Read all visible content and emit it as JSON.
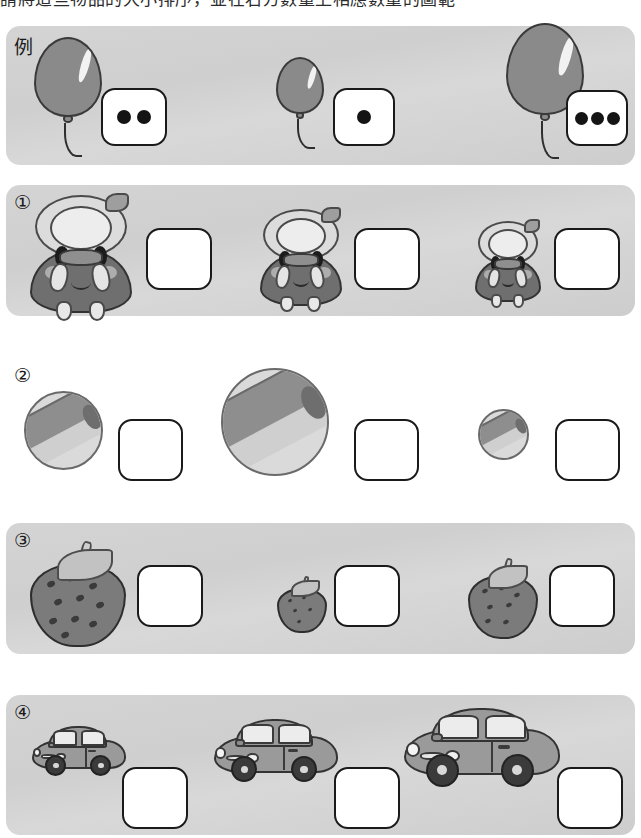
{
  "instruction": {
    "text": "請將這些物品的大小排序，並在右方數量上相應數量的圖範"
  },
  "example_row": {
    "label": "例",
    "items": [
      {
        "icon": "balloon-icon",
        "size": "medium",
        "dots": 2
      },
      {
        "icon": "balloon-icon",
        "size": "small",
        "dots": 1
      },
      {
        "icon": "balloon-icon",
        "size": "large",
        "dots": 3
      }
    ]
  },
  "rows": [
    {
      "label": "①",
      "subject": "doll",
      "background": "shaded",
      "items": [
        {
          "icon": "doll-icon",
          "size": "large",
          "answer": ""
        },
        {
          "icon": "doll-icon",
          "size": "medium",
          "answer": ""
        },
        {
          "icon": "doll-icon",
          "size": "small",
          "answer": ""
        }
      ]
    },
    {
      "label": "②",
      "subject": "beach-ball",
      "background": "plain",
      "items": [
        {
          "icon": "beach-ball-icon",
          "size": "medium",
          "answer": ""
        },
        {
          "icon": "beach-ball-icon",
          "size": "large",
          "answer": ""
        },
        {
          "icon": "beach-ball-icon",
          "size": "small",
          "answer": ""
        }
      ]
    },
    {
      "label": "③",
      "subject": "strawberry",
      "background": "shaded",
      "items": [
        {
          "icon": "strawberry-icon",
          "size": "large",
          "answer": ""
        },
        {
          "icon": "strawberry-icon",
          "size": "small",
          "answer": ""
        },
        {
          "icon": "strawberry-icon",
          "size": "medium",
          "answer": ""
        }
      ]
    },
    {
      "label": "④",
      "subject": "car",
      "background": "shaded",
      "items": [
        {
          "icon": "car-icon",
          "size": "small",
          "answer": ""
        },
        {
          "icon": "car-icon",
          "size": "medium",
          "answer": ""
        },
        {
          "icon": "car-icon",
          "size": "large",
          "answer": ""
        }
      ]
    }
  ],
  "colors": {
    "panel_background": "#d4d4d4",
    "page_background": "#ffffff",
    "outline": "#1a1a1a",
    "figure_fill": "#8a8a8a",
    "dot_fill": "#141414"
  }
}
